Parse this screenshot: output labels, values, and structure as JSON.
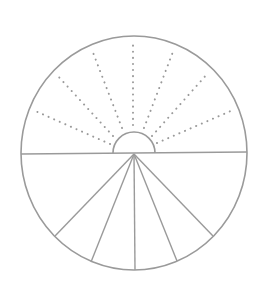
{
  "diagram": {
    "title": "",
    "colors": {
      "stroke": "#9a9a9a",
      "dots": "#9a9a9a",
      "background": "#ffffff"
    },
    "outer_circle": {
      "cx": 134,
      "cy": 153,
      "rx": 113,
      "ry": 117
    },
    "diameter": {
      "x1": 21,
      "y1": 154,
      "x2": 247,
      "y2": 152
    },
    "inner_semicircle": {
      "cx": 134,
      "cy": 153,
      "r": 21
    },
    "dotted_rays": [
      {
        "x1": 110,
        "y1": 144,
        "x2": 33,
        "y2": 110
      },
      {
        "x1": 113,
        "y1": 136,
        "x2": 57,
        "y2": 75
      },
      {
        "x1": 122,
        "y1": 128,
        "x2": 92,
        "y2": 50
      },
      {
        "x1": 133,
        "y1": 125,
        "x2": 133,
        "y2": 42
      },
      {
        "x1": 144,
        "y1": 128,
        "x2": 174,
        "y2": 49
      },
      {
        "x1": 152,
        "y1": 136,
        "x2": 208,
        "y2": 73
      },
      {
        "x1": 157,
        "y1": 143,
        "x2": 233,
        "y2": 110
      }
    ],
    "solid_rays": [
      {
        "x1": 134,
        "y1": 154,
        "x2": 55,
        "y2": 236
      },
      {
        "x1": 134,
        "y1": 154,
        "x2": 91,
        "y2": 262
      },
      {
        "x1": 134,
        "y1": 154,
        "x2": 135,
        "y2": 270
      },
      {
        "x1": 134,
        "y1": 154,
        "x2": 177,
        "y2": 261
      },
      {
        "x1": 134,
        "y1": 154,
        "x2": 213,
        "y2": 236
      }
    ]
  }
}
